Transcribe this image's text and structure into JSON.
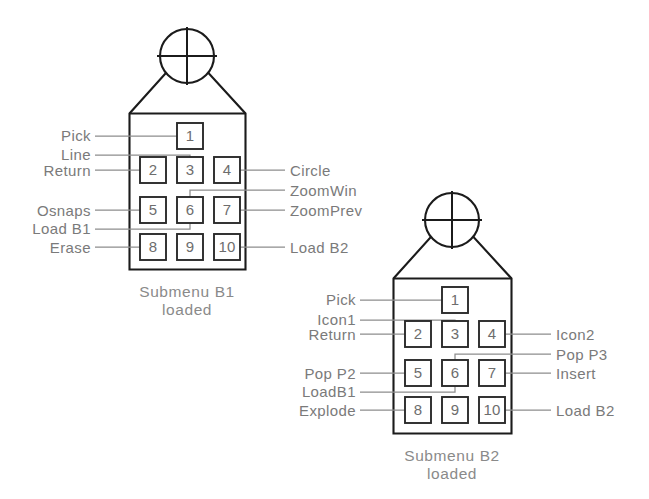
{
  "diagram": {
    "type": "digitizer-puck-button-map",
    "pucks": [
      {
        "id": "puck-b1",
        "caption_line1": "Submenu  B1",
        "caption_line2": "loaded",
        "buttons": [
          {
            "number": "1",
            "label": "Pick",
            "side": "left"
          },
          {
            "number": "2",
            "label": "Return",
            "side": "left"
          },
          {
            "number": "3",
            "label": "Line",
            "side": "left"
          },
          {
            "number": "4",
            "label": "Circle",
            "side": "right"
          },
          {
            "number": "5",
            "label": "Osnaps",
            "side": "left"
          },
          {
            "number": "6",
            "label": "ZoomWin",
            "side": "right"
          },
          {
            "number": "7",
            "label": "ZoomPrev",
            "side": "right"
          },
          {
            "number": "8",
            "label": "Erase",
            "side": "left"
          },
          {
            "number": "9",
            "label": "Load  B1",
            "side": "left"
          },
          {
            "number": "10",
            "label": "Load  B2",
            "side": "right"
          }
        ]
      },
      {
        "id": "puck-b2",
        "caption_line1": "Submenu  B2",
        "caption_line2": "loaded",
        "buttons": [
          {
            "number": "1",
            "label": "Pick",
            "side": "left"
          },
          {
            "number": "2",
            "label": "Return",
            "side": "left"
          },
          {
            "number": "3",
            "label": "Icon1",
            "side": "left"
          },
          {
            "number": "4",
            "label": "Icon2",
            "side": "right"
          },
          {
            "number": "5",
            "label": "Pop  P2",
            "side": "left"
          },
          {
            "number": "6",
            "label": "Pop  P3",
            "side": "right"
          },
          {
            "number": "7",
            "label": "Insert",
            "side": "right"
          },
          {
            "number": "8",
            "label": "Explode",
            "side": "left"
          },
          {
            "number": "9",
            "label": "LoadB1",
            "side": "left"
          },
          {
            "number": "10",
            "label": "Load  B2",
            "side": "right"
          }
        ]
      }
    ],
    "colors": {
      "outline": "#1b1b1b",
      "button_stroke": "#2a2a2a",
      "leader": "#8d8d8d",
      "text": "#7a7a7a",
      "background": "#ffffff"
    }
  }
}
